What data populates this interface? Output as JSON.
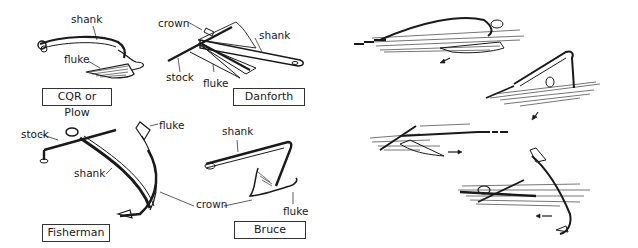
{
  "anchors": [
    {
      "name": "CQR or Plow",
      "parts": [
        "shank",
        "fluke"
      ]
    },
    {
      "name": "Danforth",
      "parts": [
        "crown",
        "shank",
        "stock",
        "fluke"
      ]
    },
    {
      "name": "Fisherman",
      "parts": [
        "stock",
        "fluke",
        "shank",
        "crown"
      ]
    },
    {
      "name": "Bruce",
      "parts": [
        "shank",
        "fluke",
        "crown"
      ]
    }
  ],
  "labels": {
    "cqr_shank": "shank",
    "cqr_fluke": "fluke",
    "danforth_crown": "crown",
    "danforth_shank": "shank",
    "danforth_stock": "stock",
    "danforth_fluke": "fluke",
    "fisherman_stock": "stock",
    "fisherman_fluke": "fluke",
    "fisherman_shank": "shank",
    "shared_crown": "crown",
    "bruce_shank": "shank",
    "bruce_fluke": "fluke"
  },
  "setting_sequence": {
    "description": "Illustrations of anchors digging into the seabed",
    "steps": [
      {
        "anchor": "Plow",
        "state": "lying on seabed, being pulled",
        "arrow": "down-left"
      },
      {
        "anchor": "Plow",
        "state": "fluke digging in",
        "arrow": "down-left"
      },
      {
        "anchor": "Danforth",
        "state": "flukes burying",
        "arrow": "right"
      },
      {
        "anchor": "Fisherman",
        "state": "fluke hooked into seabed",
        "arrow": "left"
      }
    ]
  },
  "colors": {
    "ink": "#1a1a1a",
    "background": "#ffffff"
  }
}
